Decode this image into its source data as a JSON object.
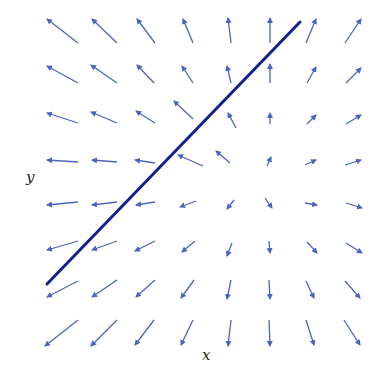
{
  "chart_data": {
    "type": "vector_field",
    "title": "",
    "xlabel": "x",
    "ylabel": "y",
    "grid": false,
    "colors": {
      "arrows": "#4a64c0",
      "line": "#14208c",
      "background": "#ffffff"
    },
    "line": {
      "x1": 47,
      "y1": 284,
      "x2": 300,
      "y2": 22,
      "width": 3
    },
    "arrows": [
      [
        [
          78,
          43,
          47,
          19
        ],
        [
          117,
          43,
          92,
          19
        ],
        [
          155,
          43,
          137,
          19
        ],
        [
          193,
          43,
          183,
          19
        ],
        [
          231,
          43,
          228,
          18
        ],
        [
          270,
          43,
          270,
          18
        ],
        [
          306,
          43,
          316,
          19
        ],
        [
          345,
          43,
          361,
          19
        ]
      ],
      [
        [
          78,
          83,
          47,
          66
        ],
        [
          117,
          83,
          91,
          65
        ],
        [
          154,
          83,
          137,
          65
        ],
        [
          193,
          83,
          182,
          66
        ],
        [
          231,
          83,
          227,
          66
        ],
        [
          270,
          83,
          270,
          64
        ],
        [
          307,
          83,
          316,
          67
        ],
        [
          346,
          83,
          361,
          68
        ]
      ],
      [
        [
          78,
          123,
          47,
          113
        ],
        [
          117,
          123,
          91,
          112
        ],
        [
          155,
          123,
          136,
          111
        ],
        [
          193,
          119,
          174,
          101
        ],
        [
          236,
          128,
          228,
          113
        ],
        [
          270,
          124,
          270,
          113
        ],
        [
          307,
          124,
          316,
          115
        ],
        [
          346,
          124,
          361,
          115
        ]
      ],
      [
        [
          78,
          162,
          47,
          160
        ],
        [
          117,
          162,
          92,
          160
        ],
        [
          155,
          163,
          135,
          160
        ],
        [
          203,
          166,
          178,
          155
        ],
        [
          230,
          163,
          216,
          151
        ],
        [
          267,
          166,
          271,
          157
        ],
        [
          305,
          165,
          316,
          160
        ],
        [
          345,
          165,
          361,
          160
        ]
      ],
      [
        [
          78,
          202,
          47,
          205
        ],
        [
          117,
          202,
          92,
          205
        ],
        [
          155,
          202,
          136,
          205
        ],
        [
          196,
          201,
          180,
          207
        ],
        [
          234,
          200,
          227,
          209
        ],
        [
          265,
          198,
          272,
          208
        ],
        [
          305,
          203,
          317,
          205
        ],
        [
          346,
          203,
          362,
          208
        ]
      ],
      [
        [
          78,
          241,
          47,
          250
        ],
        [
          117,
          241,
          92,
          250
        ],
        [
          155,
          241,
          135,
          251
        ],
        [
          195,
          241,
          182,
          252
        ],
        [
          232,
          243,
          227,
          256
        ],
        [
          269,
          241,
          270,
          253
        ],
        [
          307,
          242,
          317,
          253
        ],
        [
          346,
          243,
          362,
          253
        ]
      ],
      [
        [
          78,
          281,
          47,
          297
        ],
        [
          117,
          280,
          92,
          297
        ],
        [
          155,
          280,
          136,
          297
        ],
        [
          194,
          280,
          181,
          298
        ],
        [
          231,
          280,
          227,
          299
        ],
        [
          269,
          280,
          270,
          299
        ],
        [
          306,
          281,
          314,
          298
        ],
        [
          345,
          281,
          360,
          298
        ]
      ],
      [
        [
          78,
          320,
          45,
          346
        ],
        [
          117,
          320,
          91,
          346
        ],
        [
          154,
          320,
          135,
          345
        ],
        [
          193,
          320,
          181,
          345
        ],
        [
          231,
          320,
          228,
          346
        ],
        [
          269,
          320,
          270,
          346
        ],
        [
          306,
          320,
          314,
          345
        ],
        [
          344,
          320,
          360,
          345
        ]
      ]
    ]
  },
  "labels": {
    "x": "x",
    "y": "y"
  }
}
